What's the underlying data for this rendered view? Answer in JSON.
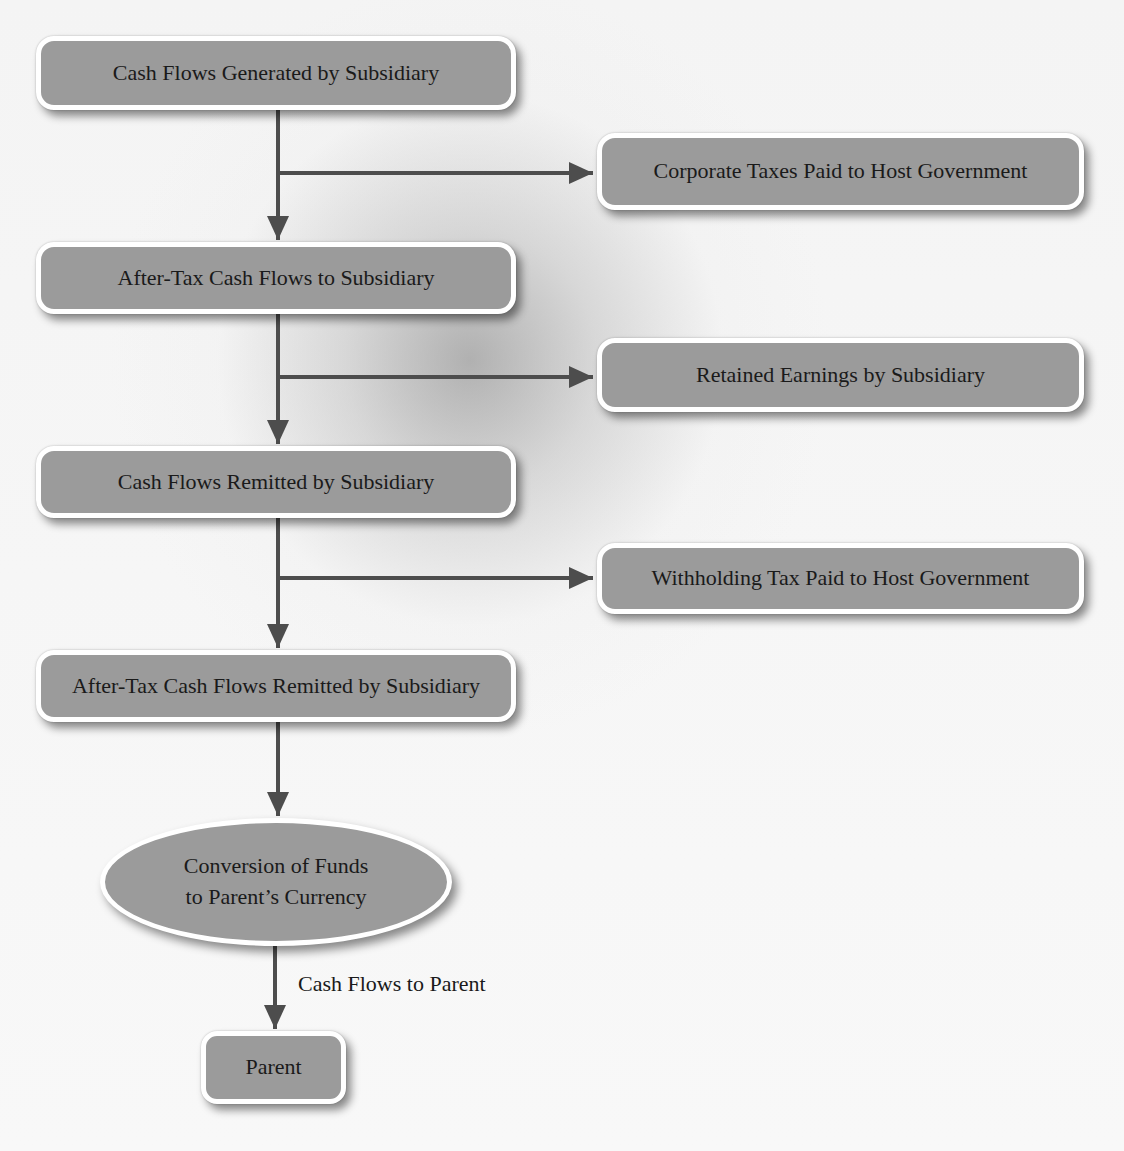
{
  "diagram": {
    "main_flow": [
      {
        "id": "generated",
        "label": "Cash Flows Generated by Subsidiary"
      },
      {
        "id": "after_tax",
        "label": "After-Tax Cash Flows to Subsidiary"
      },
      {
        "id": "remitted",
        "label": "Cash Flows Remitted by Subsidiary"
      },
      {
        "id": "after_tax_remitted",
        "label": "After-Tax Cash Flows Remitted by Subsidiary"
      }
    ],
    "side_flows": [
      {
        "id": "corporate_taxes",
        "label": "Corporate Taxes Paid to Host Government"
      },
      {
        "id": "retained",
        "label": "Retained Earnings by Subsidiary"
      },
      {
        "id": "withholding",
        "label": "Withholding Tax Paid to Host Government"
      }
    ],
    "conversion": {
      "line1": "Conversion of Funds",
      "line2": "to Parent’s Currency"
    },
    "edge_label": "Cash Flows to Parent",
    "parent": {
      "label": "Parent"
    }
  },
  "colors": {
    "box_fill": "#9b9b9b",
    "box_border": "#ffffff",
    "arrow": "#4d4d4d",
    "text": "#1a1a1a"
  }
}
